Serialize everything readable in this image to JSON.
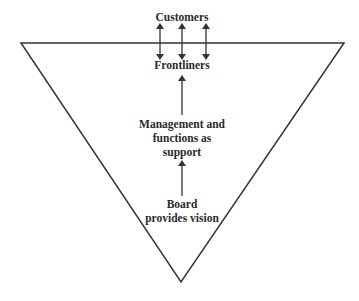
{
  "diagram": {
    "type": "inverted-pyramid",
    "colors": {
      "stroke": "#333333",
      "text": "#2a2a2a",
      "background": "#ffffff"
    },
    "labels": {
      "customers": "Customers",
      "frontliners": "Frontliners",
      "management_line1": "Management and",
      "management_line2": "functions as",
      "management_line3": "support",
      "board_line1": "Board",
      "board_line2": "provides vision"
    },
    "arrows": [
      {
        "from": "frontliners",
        "to": "customers",
        "style": "double",
        "count": 3
      },
      {
        "from": "management",
        "to": "frontliners",
        "style": "single"
      },
      {
        "from": "board",
        "to": "management",
        "style": "single"
      }
    ]
  }
}
